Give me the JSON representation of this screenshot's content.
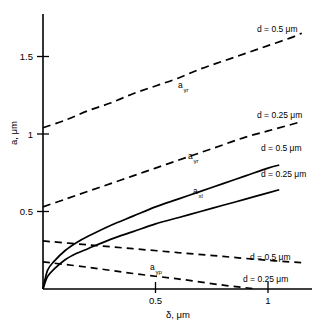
{
  "chart_data": {
    "type": "line",
    "title": "",
    "xlabel": "δ, μm",
    "ylabel": "a, μm",
    "xlim": [
      0,
      1.3
    ],
    "ylim": [
      0,
      1.75
    ],
    "grid": false,
    "legend_position": "inline-right",
    "x_ticks": [
      "0.5",
      "1"
    ],
    "x_tick_values": [
      0.5,
      1
    ],
    "y_ticks": [
      "0.5",
      "1",
      "1.5"
    ],
    "y_tick_values": [
      0.5,
      1,
      1.5
    ],
    "series": [
      {
        "name": "a_yr_d05",
        "label_text": "a",
        "label_sub": "γr",
        "style": "dashed",
        "annotation": "d = 0.5 μm",
        "x": [
          0,
          0.1,
          0.2,
          0.3,
          0.4,
          0.5,
          0.6,
          0.7,
          0.8,
          0.9,
          1.0,
          1.1,
          1.15
        ],
        "y": [
          1.04,
          1.09,
          1.15,
          1.2,
          1.26,
          1.31,
          1.36,
          1.42,
          1.47,
          1.52,
          1.57,
          1.62,
          1.65
        ]
      },
      {
        "name": "a_yr_d025",
        "label_text": "a",
        "label_sub": "γr",
        "style": "dashed",
        "annotation": "d = 0.25 μm",
        "x": [
          0,
          0.1,
          0.2,
          0.3,
          0.4,
          0.5,
          0.6,
          0.7,
          0.8,
          0.9,
          1.0,
          1.1,
          1.15
        ],
        "y": [
          0.53,
          0.58,
          0.63,
          0.68,
          0.73,
          0.78,
          0.83,
          0.88,
          0.93,
          0.98,
          1.02,
          1.06,
          1.08
        ]
      },
      {
        "name": "a_xl_d05",
        "label_text": "a",
        "label_sub": "xl",
        "style": "solid",
        "annotation": "d = 0.5 μm",
        "x": [
          0,
          0.02,
          0.05,
          0.1,
          0.15,
          0.2,
          0.3,
          0.4,
          0.5,
          0.6,
          0.7,
          0.8,
          0.9,
          1.0,
          1.05
        ],
        "y": [
          0,
          0.12,
          0.18,
          0.25,
          0.3,
          0.34,
          0.41,
          0.47,
          0.53,
          0.58,
          0.63,
          0.68,
          0.73,
          0.78,
          0.8
        ]
      },
      {
        "name": "a_xl_d025",
        "label_text": "a",
        "label_sub": "xl",
        "style": "solid",
        "annotation": "d = 0.25 μm",
        "x": [
          0,
          0.02,
          0.05,
          0.1,
          0.15,
          0.2,
          0.3,
          0.4,
          0.5,
          0.6,
          0.7,
          0.8,
          0.9,
          1.0,
          1.05
        ],
        "y": [
          0,
          0.08,
          0.13,
          0.19,
          0.23,
          0.26,
          0.32,
          0.37,
          0.42,
          0.46,
          0.5,
          0.54,
          0.58,
          0.62,
          0.64
        ]
      },
      {
        "name": "a_yp_d05",
        "label_text": "a",
        "label_sub": "γp",
        "style": "dashed",
        "annotation": "d = 0.5 μm",
        "x": [
          0,
          0.2,
          0.4,
          0.6,
          0.8,
          1.0,
          1.15
        ],
        "y": [
          0.31,
          0.285,
          0.26,
          0.235,
          0.21,
          0.185,
          0.17
        ]
      },
      {
        "name": "a_yp_d025",
        "label_text": "a",
        "label_sub": "γp",
        "style": "dashed",
        "annotation": "d = 0.25 μm",
        "x": [
          0,
          0.2,
          0.4,
          0.6,
          0.8,
          0.95
        ],
        "y": [
          0.175,
          0.14,
          0.1,
          0.065,
          0.025,
          0.0
        ]
      }
    ],
    "annotations": [
      {
        "name": "ann-ayr-d05",
        "text": "d = 0.5 μm",
        "x_px": 257,
        "y_px": 32
      },
      {
        "name": "ann-ayr-d025",
        "text": "d = 0.25 μm",
        "x_px": 257,
        "y_px": 118
      },
      {
        "name": "ann-axl-d05",
        "text": "d = 0.5 μm",
        "x_px": 261,
        "y_px": 151
      },
      {
        "name": "ann-axl-d025",
        "text": "d = 0.25 μm",
        "x_px": 261,
        "y_px": 177
      },
      {
        "name": "ann-ayp-d05",
        "text": "d = 0.5 μm",
        "x_px": 250,
        "y_px": 260
      },
      {
        "name": "ann-ayp-d025",
        "text": "d = 0.25 μm",
        "x_px": 243,
        "y_px": 282
      }
    ],
    "series_labels": [
      {
        "name": "label-ayr-upper",
        "base": "a",
        "sub": "γr",
        "x_px": 178,
        "y_px": 88
      },
      {
        "name": "label-ayr-lower",
        "base": "a",
        "sub": "γr",
        "x_px": 188,
        "y_px": 159
      },
      {
        "name": "label-axl",
        "base": "a",
        "sub": "xl",
        "x_px": 193,
        "y_px": 194
      },
      {
        "name": "label-ayp",
        "base": "a",
        "sub": "γp",
        "x_px": 150,
        "y_px": 270
      }
    ]
  }
}
